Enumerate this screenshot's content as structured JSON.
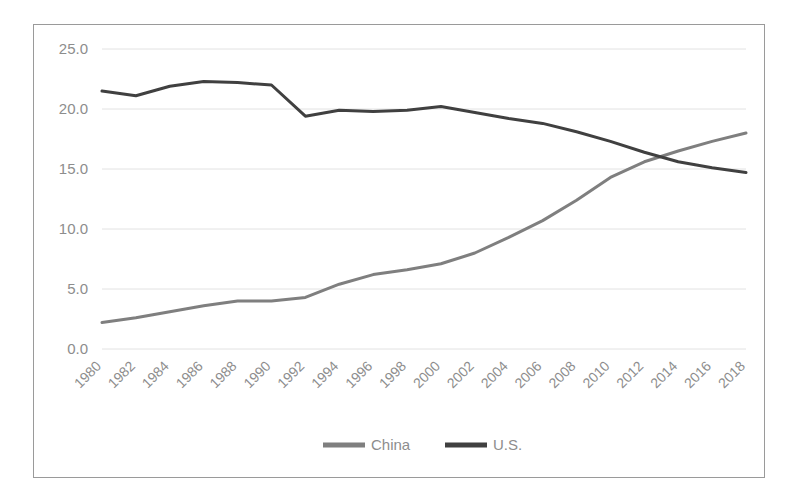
{
  "chart_data": {
    "type": "line",
    "title": "",
    "subtitle": "",
    "xlabel": "",
    "ylabel": "",
    "x": [
      1980,
      1982,
      1984,
      1986,
      1988,
      1990,
      1992,
      1994,
      1996,
      1998,
      2000,
      2002,
      2004,
      2006,
      2008,
      2010,
      2012,
      2014,
      2016,
      2018
    ],
    "categories": [
      "1980",
      "1982",
      "1984",
      "1986",
      "1988",
      "1990",
      "1992",
      "1994",
      "1996",
      "1998",
      "2000",
      "2002",
      "2004",
      "2006",
      "2008",
      "2010",
      "2012",
      "2014",
      "2016",
      "2018"
    ],
    "xlim": [
      1980,
      2018
    ],
    "ylim": [
      0.0,
      25.0
    ],
    "yticks": [
      0.0,
      5.0,
      10.0,
      15.0,
      20.0,
      25.0
    ],
    "ytick_labels": [
      "0.0",
      "5.0",
      "10.0",
      "15.0",
      "20.0",
      "25.0"
    ],
    "xtick_rotation_deg": 45,
    "grid": "horizontal",
    "legend_position": "bottom",
    "series": [
      {
        "name": "China",
        "color": "#7f7f7f",
        "linewidth": 3,
        "values": [
          2.2,
          2.6,
          3.1,
          3.6,
          4.0,
          4.0,
          4.3,
          5.4,
          6.2,
          6.6,
          7.1,
          8.0,
          9.3,
          10.7,
          12.4,
          14.3,
          15.6,
          16.5,
          17.3,
          18.0
        ]
      },
      {
        "name": "U.S.",
        "color": "#404040",
        "linewidth": 3,
        "values": [
          21.5,
          21.1,
          21.9,
          22.3,
          22.2,
          22.0,
          19.4,
          19.9,
          19.8,
          19.9,
          20.2,
          19.7,
          19.2,
          18.8,
          18.1,
          17.3,
          16.4,
          15.6,
          15.1,
          14.7
        ]
      }
    ],
    "annotations": [
      {
        "text": "series crossover",
        "x": 2013,
        "y": 15.8
      }
    ]
  },
  "legend": {
    "items": [
      {
        "label": "China",
        "color": "#7f7f7f"
      },
      {
        "label": "U.S.",
        "color": "#404040"
      }
    ]
  },
  "colors": {
    "china_line": "#7f7f7f",
    "us_line": "#404040",
    "gridline": "#e2e2e2",
    "tick_text": "#8d8d8d",
    "frame_border": "#9a9a9a",
    "background": "#ffffff"
  }
}
